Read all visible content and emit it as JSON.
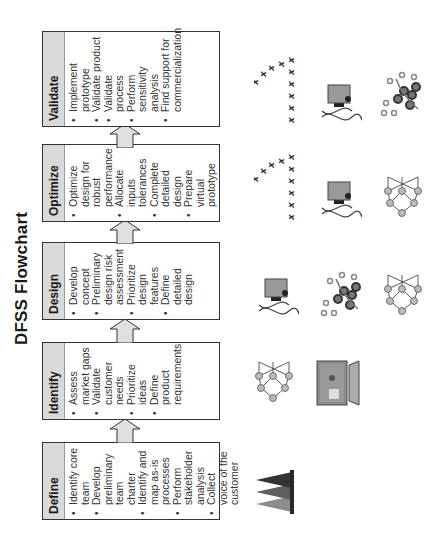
{
  "title": "DFSS Flowchart",
  "stages": [
    {
      "name": "Define",
      "items": [
        "Identify core team",
        "Develop preliminary team charter",
        "Identify and map as-is processes",
        "Perform stakeholder analysis",
        "Collect voice of the customer"
      ],
      "icons": [
        "stacked-triangles-icon"
      ]
    },
    {
      "name": "Identify",
      "items": [
        "Assess market gaps",
        "Validate customer needs",
        "Prioritize ideas",
        "Define product requirements"
      ],
      "icons": [
        "network-graph-icon",
        "computer-monitor-icon"
      ]
    },
    {
      "name": "Design",
      "items": [
        "Develop concept",
        "Preliminary design risk assessment",
        "Prioritize design features",
        "Define detailed design"
      ],
      "icons": [
        "dna-machine-icon",
        "molecule-cluster-icon",
        "network-graph-icon"
      ]
    },
    {
      "name": "Optimize",
      "items": [
        "Optimize design for robust performance",
        "Allocate inputs tolerances",
        "Complete detailed design",
        "Prepare virtual prototype"
      ],
      "icons": [
        "x-marks-pattern-icon",
        "dna-machine-icon",
        "network-graph-icon"
      ]
    },
    {
      "name": "Validate",
      "items": [
        "Implement prototype",
        "Validate product",
        "Validate process",
        "Perform sensitivity analysis",
        "Find support for commercialization"
      ],
      "icons": [
        "x-marks-pattern-icon",
        "dna-machine-icon",
        "molecule-cluster-icon"
      ]
    }
  ],
  "colors": {
    "header_fill": "#d9d9d9",
    "border": "#333333",
    "arrow_fill": "#e0e0e0"
  }
}
